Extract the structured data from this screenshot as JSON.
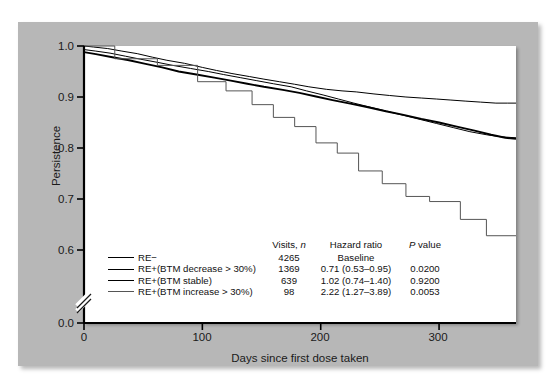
{
  "chart_data": {
    "type": "line",
    "title": "",
    "xlabel": "Days since first dose taken",
    "ylabel": "Persistence",
    "xlim": [
      0,
      365
    ],
    "ylim": [
      0.0,
      1.0
    ],
    "y_axis_break": true,
    "y_break_between": [
      0.0,
      0.55
    ],
    "grid": false,
    "legend_position": "inside-bottom-left",
    "xticks": [
      0,
      100,
      200,
      300
    ],
    "xticklabels": [
      "0",
      "100",
      "200",
      "300"
    ],
    "yticks": [
      0.0,
      0.6,
      0.7,
      0.8,
      0.9,
      1.0
    ],
    "yticklabels": [
      "0.0",
      "0.6",
      "0.7",
      "0.8",
      "0.9",
      "1.0"
    ],
    "series": [
      {
        "name": "RE−",
        "visits_n": "4265",
        "hazard_ratio": "Baseline",
        "p_value": "",
        "color": "#000000",
        "width": 1.0,
        "x": [
          0,
          8,
          20,
          32,
          45,
          58,
          70,
          85,
          100,
          112,
          125,
          140,
          152,
          165,
          178,
          190,
          205,
          218,
          230,
          245,
          258,
          272,
          285,
          298,
          310,
          322,
          335,
          348,
          358,
          365
        ],
        "y": [
          1.0,
          0.998,
          0.995,
          0.99,
          0.985,
          0.978,
          0.972,
          0.966,
          0.958,
          0.952,
          0.946,
          0.94,
          0.935,
          0.93,
          0.925,
          0.92,
          0.915,
          0.912,
          0.91,
          0.906,
          0.903,
          0.9,
          0.898,
          0.896,
          0.894,
          0.892,
          0.89,
          0.888,
          0.888,
          0.888
        ]
      },
      {
        "name": "RE+(BTM decrease > 30%)",
        "visits_n": "1369",
        "hazard_ratio": "0.71 (0.53–0.95)",
        "p_value": "0.0200",
        "color": "#000000",
        "width": 1.0,
        "x": [
          0,
          10,
          22,
          35,
          48,
          62,
          75,
          90,
          105,
          118,
          132,
          146,
          160,
          175,
          188,
          202,
          215,
          228,
          242,
          256,
          270,
          284,
          298,
          312,
          326,
          340,
          352,
          365
        ],
        "y": [
          0.993,
          0.99,
          0.986,
          0.98,
          0.974,
          0.968,
          0.962,
          0.956,
          0.95,
          0.944,
          0.938,
          0.932,
          0.926,
          0.92,
          0.912,
          0.904,
          0.896,
          0.888,
          0.88,
          0.872,
          0.864,
          0.856,
          0.848,
          0.84,
          0.832,
          0.826,
          0.822,
          0.82
        ]
      },
      {
        "name": "RE+(BTM stable)",
        "visits_n": "639",
        "hazard_ratio": "1.02 (0.74–1.40)",
        "p_value": "0.9200",
        "color": "#000000",
        "width": 1.9,
        "x": [
          0,
          10,
          24,
          38,
          52,
          66,
          80,
          95,
          110,
          124,
          138,
          152,
          168,
          182,
          196,
          210,
          225,
          240,
          255,
          270,
          285,
          300,
          315,
          330,
          344,
          356,
          365
        ],
        "y": [
          0.988,
          0.984,
          0.978,
          0.972,
          0.965,
          0.958,
          0.95,
          0.944,
          0.938,
          0.932,
          0.926,
          0.92,
          0.914,
          0.908,
          0.901,
          0.894,
          0.887,
          0.88,
          0.872,
          0.865,
          0.857,
          0.85,
          0.842,
          0.834,
          0.826,
          0.82,
          0.818
        ]
      },
      {
        "name": "RE+(BTM increase > 30%)",
        "visits_n": "98",
        "hazard_ratio": "2.22 (1.27–3.89)",
        "p_value": "0.0053",
        "color": "#555555",
        "width": 1.0,
        "x": [
          0,
          26,
          26,
          62,
          62,
          96,
          96,
          120,
          120,
          142,
          142,
          160,
          160,
          178,
          178,
          196,
          196,
          214,
          214,
          232,
          232,
          252,
          252,
          272,
          272,
          292,
          292,
          318,
          318,
          340,
          340,
          365
        ],
        "y": [
          1.0,
          1.0,
          0.975,
          0.975,
          0.962,
          0.962,
          0.93,
          0.93,
          0.912,
          0.912,
          0.885,
          0.885,
          0.86,
          0.86,
          0.842,
          0.842,
          0.81,
          0.81,
          0.79,
          0.79,
          0.755,
          0.755,
          0.73,
          0.73,
          0.705,
          0.705,
          0.695,
          0.695,
          0.66,
          0.66,
          0.628,
          0.628
        ]
      }
    ]
  },
  "axis": {
    "y_title": "Persistence",
    "x_title": "Days since first dose taken",
    "yticklabels": [
      "1.0",
      "0.9",
      "0.8",
      "0.7",
      "0.6",
      "0.0"
    ],
    "xticklabels": [
      "0",
      "100",
      "200",
      "300"
    ]
  },
  "legend": {
    "headers": {
      "group": "",
      "visits": "Visits, n",
      "visits_italic": "n",
      "hazard": "Hazard ratio",
      "pvalue_italic": "P",
      "pvalue": "value"
    },
    "rows": [
      {
        "label": "RE−",
        "visits": "4265",
        "hazard": "Baseline",
        "pvalue": ""
      },
      {
        "label": "RE+(BTM decrease > 30%)",
        "visits": "1369",
        "hazard": "0.71 (0.53–0.95)",
        "pvalue": "0.0200"
      },
      {
        "label": "RE+(BTM stable)",
        "visits": "639",
        "hazard": "1.02 (0.74–1.40)",
        "pvalue": "0.9200"
      },
      {
        "label": "RE+(BTM increase > 30%)",
        "visits": "98",
        "hazard": "2.22 (1.27–3.89)",
        "pvalue": "0.0053"
      }
    ]
  },
  "colors": {
    "panel_background": "#b7b7b7",
    "plot_background": "#ffffff",
    "axis": "#000000",
    "text": "#1a1a1a"
  }
}
